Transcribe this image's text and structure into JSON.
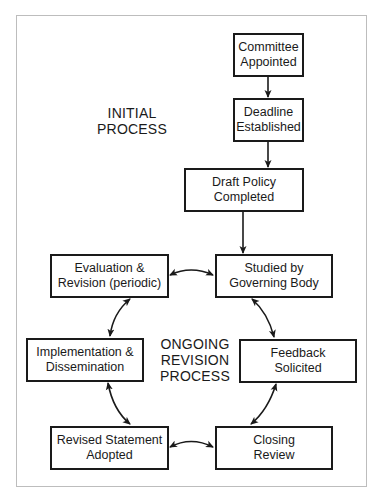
{
  "diagram": {
    "type": "flowchart",
    "sections": {
      "initial": {
        "line1": "INITIAL",
        "line2": "PROCESS"
      },
      "ongoing": {
        "line1": "ONGOING",
        "line2": "REVISION",
        "line3": "PROCESS"
      }
    },
    "nodes": [
      {
        "id": "committee",
        "line1": "Committee",
        "line2": "Appointed"
      },
      {
        "id": "deadline",
        "line1": "Deadline",
        "line2": "Established"
      },
      {
        "id": "draft",
        "line1": "Draft Policy",
        "line2": "Completed"
      },
      {
        "id": "studied",
        "line1": "Studied by",
        "line2": "Governing Body"
      },
      {
        "id": "feedback",
        "line1": "Feedback",
        "line2": "Solicited"
      },
      {
        "id": "closing",
        "line1": "Closing",
        "line2": "Review"
      },
      {
        "id": "revised",
        "line1": "Revised Statement",
        "line2": "Adopted"
      },
      {
        "id": "implementation",
        "line1": "Implementation &",
        "line2": "Dissemination"
      },
      {
        "id": "evaluation",
        "line1": "Evaluation &",
        "line2": "Revision (periodic)"
      }
    ],
    "edges": [
      {
        "from": "committee",
        "to": "deadline",
        "style": "one-way"
      },
      {
        "from": "deadline",
        "to": "draft",
        "style": "one-way"
      },
      {
        "from": "draft",
        "to": "studied",
        "style": "one-way"
      },
      {
        "from": "studied",
        "to": "feedback",
        "style": "two-way"
      },
      {
        "from": "feedback",
        "to": "closing",
        "style": "two-way"
      },
      {
        "from": "closing",
        "to": "revised",
        "style": "two-way"
      },
      {
        "from": "revised",
        "to": "implementation",
        "style": "two-way"
      },
      {
        "from": "implementation",
        "to": "evaluation",
        "style": "two-way"
      },
      {
        "from": "evaluation",
        "to": "studied",
        "style": "two-way"
      }
    ],
    "colors": {
      "stroke": "#1a1a1a",
      "frame": "#bdbdbd",
      "background": "#ffffff"
    }
  }
}
